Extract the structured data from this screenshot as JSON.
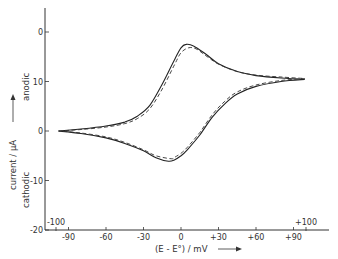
{
  "chart_data": {
    "type": "line",
    "title": "",
    "xlabel": "(E - E°) / mV",
    "ylabel": "current / μA",
    "ylabel_top": "anodic",
    "ylabel_bottom": "cathodic",
    "xlim": [
      -100,
      100
    ],
    "ylim": [
      -20,
      20
    ],
    "grid": false,
    "x_ticks": [
      {
        "value": -90,
        "label": "-90"
      },
      {
        "value": -60,
        "label": "-60"
      },
      {
        "value": -30,
        "label": "-30"
      },
      {
        "value": 0,
        "label": "0"
      },
      {
        "value": 30,
        "label": "+30"
      },
      {
        "value": 60,
        "label": "+60"
      },
      {
        "value": 90,
        "label": "+90"
      }
    ],
    "x_extra_ticks": [
      {
        "value": -100,
        "label": "-100"
      },
      {
        "value": 100,
        "label": "+100"
      }
    ],
    "y_ticks": [
      {
        "value": 20,
        "label": "0"
      },
      {
        "value": 10,
        "label": "10"
      },
      {
        "value": 0,
        "label": "0"
      },
      {
        "value": -10,
        "label": "-10"
      },
      {
        "value": -20,
        "label": "-20"
      }
    ],
    "series": [
      {
        "name": "experimental (solid)",
        "style": "solid",
        "forward_scan": {
          "x": [
            -98,
            -80,
            -60,
            -45,
            -35,
            -25,
            -15,
            -5,
            0,
            4,
            10,
            20,
            30,
            45,
            60,
            80,
            99
          ],
          "y": [
            0.0,
            0.4,
            1.0,
            1.8,
            3.0,
            5.2,
            9.5,
            14.5,
            16.8,
            17.5,
            17.2,
            15.5,
            13.6,
            12.0,
            11.2,
            10.7,
            10.4
          ]
        },
        "reverse_scan": {
          "x": [
            99,
            80,
            60,
            45,
            35,
            25,
            15,
            5,
            0,
            -5,
            -10,
            -20,
            -30,
            -45,
            -60,
            -80,
            -98
          ],
          "y": [
            10.4,
            10.0,
            9.0,
            7.5,
            5.5,
            2.8,
            -0.8,
            -3.8,
            -5.0,
            -5.8,
            -6.1,
            -5.4,
            -4.0,
            -2.5,
            -1.4,
            -0.5,
            0.0
          ]
        }
      },
      {
        "name": "simulated (dashed)",
        "style": "dashed",
        "forward_scan": {
          "x": [
            -98,
            -80,
            -60,
            -45,
            -35,
            -25,
            -15,
            -5,
            0,
            6,
            12,
            20,
            30,
            45,
            60,
            80,
            99
          ],
          "y": [
            0.0,
            0.3,
            0.8,
            1.5,
            2.5,
            4.5,
            8.5,
            13.5,
            15.8,
            16.8,
            16.6,
            15.2,
            13.5,
            12.0,
            11.3,
            10.9,
            10.6
          ]
        },
        "reverse_scan": {
          "x": [
            99,
            80,
            60,
            45,
            35,
            25,
            15,
            5,
            0,
            -5,
            -8,
            -20,
            -30,
            -45,
            -60,
            -80,
            -98
          ],
          "y": [
            10.6,
            10.2,
            9.3,
            7.9,
            6.0,
            3.3,
            -0.3,
            -3.3,
            -4.5,
            -5.3,
            -5.6,
            -5.0,
            -3.8,
            -2.3,
            -1.2,
            -0.4,
            0.0
          ]
        }
      }
    ]
  }
}
